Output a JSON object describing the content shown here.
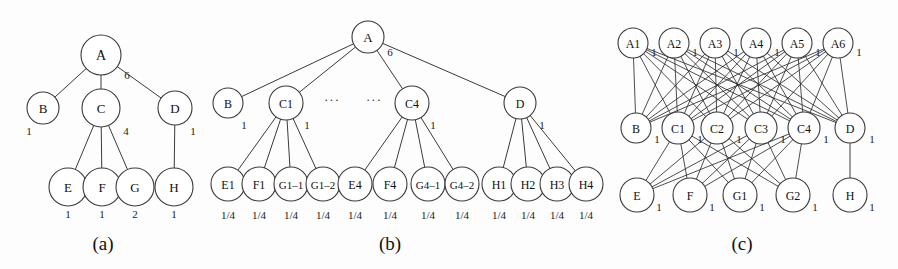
{
  "figure": {
    "background_color": "#fdfdfd",
    "stroke_color": "#3a3a3a",
    "text_color": "#111111"
  },
  "captions": [
    {
      "name": "caption-a",
      "text": "(a)",
      "x": 103,
      "y": 243
    },
    {
      "name": "caption-b",
      "text": "(b)",
      "x": 390,
      "y": 243
    },
    {
      "name": "caption-c",
      "text": "(c)",
      "x": 742,
      "y": 243
    }
  ],
  "panels": [
    {
      "id": "panel-a",
      "caption": "(a)",
      "nodes": [
        {
          "id": "a-A",
          "label": "A",
          "x": 101,
          "y": 55,
          "r": 20,
          "font": 14,
          "weight": {
            "text": "6",
            "x": 127,
            "y": 75
          }
        },
        {
          "id": "a-B",
          "label": "B",
          "x": 43,
          "y": 108,
          "r": 16,
          "font": 13,
          "weight": {
            "text": "1",
            "x": 29,
            "y": 131
          }
        },
        {
          "id": "a-C",
          "label": "C",
          "x": 101,
          "y": 108,
          "r": 19,
          "font": 13,
          "weight": {
            "text": "4",
            "x": 126,
            "y": 131
          }
        },
        {
          "id": "a-D",
          "label": "D",
          "x": 175,
          "y": 108,
          "r": 17,
          "font": 13,
          "weight": {
            "text": "1",
            "x": 193,
            "y": 131
          }
        },
        {
          "id": "a-E",
          "label": "E",
          "x": 68,
          "y": 187,
          "r": 19,
          "font": 13,
          "weight": {
            "text": "1",
            "x": 68,
            "y": 214
          }
        },
        {
          "id": "a-F",
          "label": "F",
          "x": 102,
          "y": 187,
          "r": 19,
          "font": 13,
          "weight": {
            "text": "1",
            "x": 102,
            "y": 214
          }
        },
        {
          "id": "a-G",
          "label": "G",
          "x": 135,
          "y": 187,
          "r": 19,
          "font": 13,
          "weight": {
            "text": "2",
            "x": 135,
            "y": 214
          }
        },
        {
          "id": "a-H",
          "label": "H",
          "x": 174,
          "y": 187,
          "r": 19,
          "font": 13,
          "weight": {
            "text": "1",
            "x": 174,
            "y": 214
          }
        }
      ],
      "edges": [
        {
          "from": "a-A",
          "to": "a-B"
        },
        {
          "from": "a-A",
          "to": "a-C"
        },
        {
          "from": "a-A",
          "to": "a-D"
        },
        {
          "from": "a-C",
          "to": "a-E"
        },
        {
          "from": "a-C",
          "to": "a-F"
        },
        {
          "from": "a-C",
          "to": "a-G"
        },
        {
          "from": "a-D",
          "to": "a-H"
        }
      ],
      "ellipses": []
    },
    {
      "id": "panel-b",
      "caption": "(b)",
      "nodes": [
        {
          "id": "b-A",
          "label": "A",
          "x": 368,
          "y": 37,
          "r": 16,
          "font": 13,
          "weight": {
            "text": "6",
            "x": 390,
            "y": 52
          }
        },
        {
          "id": "b-B",
          "label": "B",
          "x": 228,
          "y": 103,
          "r": 15,
          "font": 12,
          "weight": {
            "text": "1",
            "x": 244,
            "y": 125
          }
        },
        {
          "id": "b-C1",
          "label": "C1",
          "x": 286,
          "y": 103,
          "r": 17,
          "font": 12,
          "weight": {
            "text": "1",
            "x": 307,
            "y": 125
          }
        },
        {
          "id": "b-C4",
          "label": "C4",
          "x": 412,
          "y": 103,
          "r": 17,
          "font": 12,
          "weight": {
            "text": "1",
            "x": 433,
            "y": 125
          }
        },
        {
          "id": "b-D",
          "label": "D",
          "x": 520,
          "y": 103,
          "r": 16,
          "font": 12,
          "weight": {
            "text": "1",
            "x": 542,
            "y": 125
          }
        },
        {
          "id": "b-E1",
          "label": "E1",
          "x": 228,
          "y": 184,
          "r": 17,
          "font": 12,
          "weight": {
            "text": "1/4",
            "x": 228,
            "y": 215
          }
        },
        {
          "id": "b-F1",
          "label": "F1",
          "x": 259,
          "y": 184,
          "r": 17,
          "font": 12,
          "weight": {
            "text": "1/4",
            "x": 259,
            "y": 215
          }
        },
        {
          "id": "b-G1-1",
          "label": "G1–1",
          "x": 291,
          "y": 184,
          "r": 17,
          "font": 11,
          "weight": {
            "text": "1/4",
            "x": 291,
            "y": 215
          }
        },
        {
          "id": "b-G1-2",
          "label": "G1–2",
          "x": 323,
          "y": 184,
          "r": 17,
          "font": 11,
          "weight": {
            "text": "1/4",
            "x": 323,
            "y": 215
          }
        },
        {
          "id": "b-E4",
          "label": "E4",
          "x": 355,
          "y": 184,
          "r": 17,
          "font": 12,
          "weight": {
            "text": "1/4",
            "x": 355,
            "y": 215
          }
        },
        {
          "id": "b-F4",
          "label": "F4",
          "x": 390,
          "y": 184,
          "r": 17,
          "font": 12,
          "weight": {
            "text": "1/4",
            "x": 390,
            "y": 215
          }
        },
        {
          "id": "b-G4-1",
          "label": "G4–1",
          "x": 428,
          "y": 184,
          "r": 17,
          "font": 11,
          "weight": {
            "text": "1/4",
            "x": 428,
            "y": 215
          }
        },
        {
          "id": "b-G4-2",
          "label": "G4–2",
          "x": 462,
          "y": 184,
          "r": 17,
          "font": 11,
          "weight": {
            "text": "1/4",
            "x": 462,
            "y": 215
          }
        },
        {
          "id": "b-H1",
          "label": "H1",
          "x": 499,
          "y": 184,
          "r": 17,
          "font": 12,
          "weight": {
            "text": "1/4",
            "x": 499,
            "y": 215
          }
        },
        {
          "id": "b-H2",
          "label": "H2",
          "x": 528,
          "y": 184,
          "r": 17,
          "font": 12,
          "weight": {
            "text": "1/4",
            "x": 528,
            "y": 215
          }
        },
        {
          "id": "b-H3",
          "label": "H3",
          "x": 557,
          "y": 184,
          "r": 17,
          "font": 12,
          "weight": {
            "text": "1/4",
            "x": 557,
            "y": 215
          }
        },
        {
          "id": "b-H4",
          "label": "H4",
          "x": 586,
          "y": 184,
          "r": 17,
          "font": 12,
          "weight": {
            "text": "1/4",
            "x": 586,
            "y": 215
          }
        }
      ],
      "edges": [
        {
          "from": "b-A",
          "to": "b-B"
        },
        {
          "from": "b-A",
          "to": "b-C1"
        },
        {
          "from": "b-A",
          "to": "b-C4"
        },
        {
          "from": "b-A",
          "to": "b-D"
        },
        {
          "from": "b-C1",
          "to": "b-E1"
        },
        {
          "from": "b-C1",
          "to": "b-F1"
        },
        {
          "from": "b-C1",
          "to": "b-G1-1"
        },
        {
          "from": "b-C1",
          "to": "b-G1-2"
        },
        {
          "from": "b-C4",
          "to": "b-E4"
        },
        {
          "from": "b-C4",
          "to": "b-F4"
        },
        {
          "from": "b-C4",
          "to": "b-G4-1"
        },
        {
          "from": "b-C4",
          "to": "b-G4-2"
        },
        {
          "from": "b-D",
          "to": "b-H1"
        },
        {
          "from": "b-D",
          "to": "b-H2"
        },
        {
          "from": "b-D",
          "to": "b-H3"
        },
        {
          "from": "b-D",
          "to": "b-H4"
        }
      ],
      "ellipses": [
        {
          "name": "ellipsis-left",
          "text": "···",
          "x": 332,
          "y": 99
        },
        {
          "name": "ellipsis-right",
          "text": "···",
          "x": 374,
          "y": 99
        }
      ]
    },
    {
      "id": "panel-c",
      "caption": "(c)",
      "nodes": [
        {
          "id": "c-A1",
          "label": "A1",
          "x": 633,
          "y": 43,
          "r": 15,
          "font": 12,
          "weight": {
            "text": "1",
            "x": 654,
            "y": 52
          }
        },
        {
          "id": "c-A2",
          "label": "A2",
          "x": 674,
          "y": 43,
          "r": 15,
          "font": 12,
          "weight": {
            "text": "1",
            "x": 695,
            "y": 52
          }
        },
        {
          "id": "c-A3",
          "label": "A3",
          "x": 715,
          "y": 43,
          "r": 15,
          "font": 12,
          "weight": {
            "text": "1",
            "x": 736,
            "y": 52
          }
        },
        {
          "id": "c-A4",
          "label": "A4",
          "x": 756,
          "y": 43,
          "r": 15,
          "font": 12,
          "weight": {
            "text": "1",
            "x": 777,
            "y": 52
          }
        },
        {
          "id": "c-A5",
          "label": "A5",
          "x": 797,
          "y": 43,
          "r": 15,
          "font": 12,
          "weight": {
            "text": "1",
            "x": 818,
            "y": 52
          }
        },
        {
          "id": "c-A6",
          "label": "A6",
          "x": 838,
          "y": 43,
          "r": 15,
          "font": 12,
          "weight": {
            "text": "1",
            "x": 859,
            "y": 52
          }
        },
        {
          "id": "c-B",
          "label": "B",
          "x": 636,
          "y": 128,
          "r": 15,
          "font": 12,
          "weight": {
            "text": "1",
            "x": 657,
            "y": 139
          }
        },
        {
          "id": "c-C1",
          "label": "C1",
          "x": 678,
          "y": 128,
          "r": 16,
          "font": 12,
          "weight": {
            "text": "1",
            "x": 700,
            "y": 139
          }
        },
        {
          "id": "c-C2",
          "label": "C2",
          "x": 717,
          "y": 128,
          "r": 16,
          "font": 12,
          "weight": {
            "text": "1",
            "x": 739,
            "y": 139
          }
        },
        {
          "id": "c-C3",
          "label": "C3",
          "x": 761,
          "y": 128,
          "r": 16,
          "font": 12,
          "weight": {
            "text": "1",
            "x": 783,
            "y": 139
          }
        },
        {
          "id": "c-C4",
          "label": "C4",
          "x": 804,
          "y": 128,
          "r": 16,
          "font": 12,
          "weight": {
            "text": "1",
            "x": 826,
            "y": 139
          }
        },
        {
          "id": "c-D",
          "label": "D",
          "x": 850,
          "y": 128,
          "r": 15,
          "font": 12,
          "weight": {
            "text": "1",
            "x": 872,
            "y": 139
          }
        },
        {
          "id": "c-E",
          "label": "E",
          "x": 637,
          "y": 195,
          "r": 17,
          "font": 12,
          "weight": {
            "text": "1",
            "x": 659,
            "y": 207
          }
        },
        {
          "id": "c-F",
          "label": "F",
          "x": 690,
          "y": 195,
          "r": 17,
          "font": 12,
          "weight": {
            "text": "1",
            "x": 712,
            "y": 207
          }
        },
        {
          "id": "c-G1",
          "label": "G1",
          "x": 740,
          "y": 195,
          "r": 17,
          "font": 12,
          "weight": {
            "text": "1",
            "x": 762,
            "y": 207
          }
        },
        {
          "id": "c-G2",
          "label": "G2",
          "x": 793,
          "y": 195,
          "r": 17,
          "font": 12,
          "weight": {
            "text": "1",
            "x": 815,
            "y": 207
          }
        },
        {
          "id": "c-H",
          "label": "H",
          "x": 850,
          "y": 195,
          "r": 17,
          "font": 12,
          "weight": {
            "text": "1",
            "x": 872,
            "y": 207
          }
        }
      ],
      "bipartite_groups": [
        {
          "name": "a-layer-to-bc-layer",
          "from": [
            "c-A1",
            "c-A2",
            "c-A3",
            "c-A4",
            "c-A5",
            "c-A6"
          ],
          "to": [
            "c-B",
            "c-C1",
            "c-C2",
            "c-C3",
            "c-C4",
            "c-D"
          ]
        },
        {
          "name": "c-layer-to-efg-layer",
          "from": [
            "c-C1",
            "c-C2",
            "c-C3",
            "c-C4"
          ],
          "to": [
            "c-E",
            "c-F",
            "c-G1",
            "c-G2"
          ]
        }
      ],
      "edges": [
        {
          "from": "c-D",
          "to": "c-H"
        }
      ],
      "ellipses": []
    }
  ]
}
